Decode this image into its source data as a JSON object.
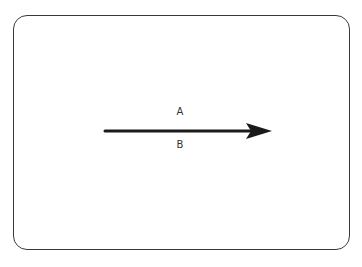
{
  "diagram": {
    "arrow": {
      "label_above": "A",
      "label_below": "B",
      "color": "#1a1a1a",
      "direction": "right"
    },
    "frame": {
      "color": "#3a3a3a"
    }
  }
}
